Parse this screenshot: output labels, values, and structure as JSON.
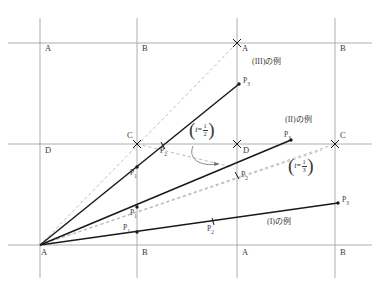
{
  "figure": {
    "title": "",
    "type": "geometry-diagram",
    "canvas": {
      "width": 377,
      "height": 286
    },
    "colors": {
      "grid": "#9a9a9a",
      "solid_ray": "#1a1a1a",
      "dashed_ray": "#b0b0b0",
      "text": "#3a3a3a",
      "background": "#ffffff"
    }
  },
  "grid": {
    "vertical_lines_x": [
      40,
      137,
      237,
      335
    ],
    "horizontal_lines_y": [
      43,
      144,
      245
    ],
    "lattice_labels": [
      {
        "text": "A",
        "x": 45,
        "y": 48
      },
      {
        "text": "B",
        "x": 142,
        "y": 48
      },
      {
        "text": "A",
        "x": 242,
        "y": 48
      },
      {
        "text": "B",
        "x": 340,
        "y": 48
      },
      {
        "text": "D",
        "x": 45,
        "y": 149
      },
      {
        "text": "C",
        "x": 128,
        "y": 136
      },
      {
        "text": "D",
        "x": 242,
        "y": 149
      },
      {
        "text": "C",
        "x": 340,
        "y": 136
      },
      {
        "text": "A",
        "x": 42,
        "y": 250
      },
      {
        "text": "B",
        "x": 142,
        "y": 250
      },
      {
        "text": "A",
        "x": 242,
        "y": 250
      },
      {
        "text": "B",
        "x": 340,
        "y": 250
      }
    ]
  },
  "rays": {
    "origin": {
      "label": "A",
      "x": 40,
      "y": 245
    },
    "solid": [
      {
        "name": "ray-III",
        "x1": 40,
        "y1": 245,
        "x2": 239,
        "y2": 84
      },
      {
        "name": "ray-II",
        "x1": 40,
        "y1": 245,
        "x2": 291,
        "y2": 140
      },
      {
        "name": "ray-I",
        "x1": 40,
        "y1": 245,
        "x2": 338,
        "y2": 203
      }
    ],
    "dashed": [
      {
        "name": "dashed-to-A-top",
        "x1": 40,
        "y1": 245,
        "x2": 237,
        "y2": 43
      },
      {
        "name": "dashed-to-C-right",
        "x1": 40,
        "y1": 245,
        "x2": 335,
        "y2": 144
      },
      {
        "name": "dashed-mid",
        "x1": 40,
        "y1": 245,
        "x2": 318,
        "y2": 152
      }
    ]
  },
  "markers": {
    "crosses": [
      {
        "name": "cross-top-A",
        "x": 237,
        "y": 43
      },
      {
        "name": "cross-left-C",
        "x": 137,
        "y": 144
      },
      {
        "name": "cross-mid-D",
        "x": 237,
        "y": 144
      },
      {
        "name": "cross-right-C",
        "x": 335,
        "y": 144
      }
    ],
    "dots": [
      {
        "name": "dot-III-P1",
        "x": 137,
        "y": 167
      },
      {
        "name": "dot-III-P3",
        "x": 239,
        "y": 84
      },
      {
        "name": "dot-II-P1",
        "x": 137,
        "y": 207
      },
      {
        "name": "dot-II-P3",
        "x": 291,
        "y": 140
      },
      {
        "name": "dot-I-P1",
        "x": 137,
        "y": 232
      },
      {
        "name": "dot-I-P3",
        "x": 338,
        "y": 203
      }
    ],
    "ticks": [
      {
        "name": "tick-III-P2",
        "x": 163,
        "y": 146
      },
      {
        "name": "tick-II-P2",
        "x": 237,
        "y": 175
      },
      {
        "name": "tick-I-P2",
        "x": 213,
        "y": 221
      }
    ]
  },
  "point_labels": [
    {
      "name": "label-III-P1",
      "base": "P",
      "sub": "1",
      "x": 131,
      "y": 172
    },
    {
      "name": "label-III-P2",
      "base": "P",
      "sub": "2",
      "x": 161,
      "y": 150
    },
    {
      "name": "label-III-P3",
      "base": "P",
      "sub": "3",
      "x": 243,
      "y": 80
    },
    {
      "name": "label-II-P1",
      "base": "P",
      "sub": "1",
      "x": 131,
      "y": 211
    },
    {
      "name": "label-II-P2",
      "base": "P",
      "sub": "2",
      "x": 241,
      "y": 174
    },
    {
      "name": "label-II-P3",
      "base": "P",
      "sub": "3",
      "x": 283,
      "y": 134
    },
    {
      "name": "label-I-P1",
      "base": "P",
      "sub": "1",
      "x": 124,
      "y": 226
    },
    {
      "name": "label-I-P2",
      "base": "P",
      "sub": "2",
      "x": 208,
      "y": 227
    },
    {
      "name": "label-I-P3",
      "base": "P",
      "sub": "3",
      "x": 342,
      "y": 199
    }
  ],
  "case_labels": [
    {
      "name": "case-label-III",
      "text": "(III)の例",
      "x": 252,
      "y": 62
    },
    {
      "name": "case-label-II",
      "text": "(II)の例",
      "x": 285,
      "y": 120
    },
    {
      "name": "case-label-I",
      "text": "(I)の例",
      "x": 267,
      "y": 222
    }
  ],
  "annotations": [
    {
      "name": "annotation-t-half",
      "variable": "t",
      "relation": "=",
      "numerator": "1",
      "denominator": "2",
      "x": 190,
      "y": 127,
      "arrow": {
        "name": "callout-arrow-t-half",
        "from_x": 196,
        "from_y": 148,
        "to_x": 222,
        "to_y": 164
      }
    },
    {
      "name": "annotation-t-third",
      "variable": "t",
      "relation": "=",
      "numerator": "1",
      "denominator": "3",
      "x": 289,
      "y": 163
    }
  ]
}
